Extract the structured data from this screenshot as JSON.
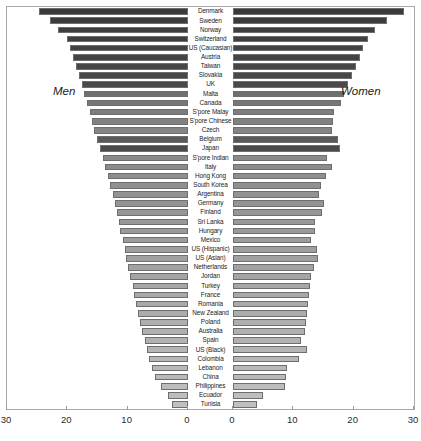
{
  "chart_data": {
    "type": "bar",
    "title": "",
    "subtitle": "",
    "orientation": "horizontal-diverging",
    "xlabel": "",
    "ylabel": "",
    "grid": false,
    "legend_position": "inside-plot",
    "axis": {
      "left_ticks": [
        "30",
        "20",
        "10",
        "0"
      ],
      "right_ticks": [
        "0",
        "10",
        "20",
        "30"
      ],
      "left_range": [
        30,
        0
      ],
      "right_range": [
        0,
        30
      ],
      "max": 30
    },
    "annotations": [
      {
        "text": "Men",
        "side": "left"
      },
      {
        "text": "Women",
        "side": "right"
      }
    ],
    "categories": [
      "Denmark",
      "Sweden",
      "Norway",
      "Switzerland",
      "US (Caucasian)",
      "Austria",
      "Taiwan",
      "Slovakia",
      "UK",
      "Malta",
      "Canada",
      "S'pore Malay",
      "S'pore Chinese",
      "Czech",
      "Belgium",
      "Japan",
      "S'pore Indian",
      "Italy",
      "Hong Kong",
      "South Korea",
      "Argentina",
      "Germany",
      "Finland",
      "Sri Lanka",
      "Hungary",
      "Mexico",
      "US (Hispanic)",
      "US (Asian)",
      "Netherlands",
      "Jordan",
      "Turkey",
      "France",
      "Romania",
      "New Zealand",
      "Poland",
      "Australia",
      "Spain",
      "US (Black)",
      "Colombia",
      "Lebanon",
      "China",
      "Philippines",
      "Ecuador",
      "Tunisia"
    ],
    "series": [
      {
        "name": "Men",
        "side": "left",
        "values": [
          24.7,
          22.8,
          21.5,
          20.0,
          19.5,
          19.0,
          18.6,
          18.1,
          17.6,
          17.2,
          16.8,
          16.3,
          15.9,
          15.5,
          15.1,
          14.6,
          14.1,
          13.7,
          13.3,
          12.9,
          12.5,
          12.1,
          11.8,
          11.5,
          11.2,
          10.8,
          10.5,
          10.2,
          9.9,
          9.6,
          9.2,
          8.9,
          8.6,
          8.3,
          8.0,
          7.6,
          7.2,
          6.8,
          6.4,
          5.9,
          5.4,
          4.4,
          3.3,
          2.6
        ]
      },
      {
        "name": "Women",
        "side": "right",
        "values": [
          28.4,
          25.6,
          23.5,
          22.3,
          21.6,
          21.0,
          20.4,
          19.8,
          19.0,
          18.4,
          17.9,
          16.8,
          16.6,
          16.4,
          17.4,
          17.8,
          15.6,
          16.4,
          15.4,
          14.6,
          14.2,
          15.0,
          14.8,
          13.6,
          13.6,
          12.9,
          14.0,
          14.1,
          13.4,
          12.9,
          12.8,
          12.6,
          12.4,
          12.2,
          12.1,
          12.0,
          11.3,
          12.3,
          11.0,
          9.0,
          8.8,
          8.6,
          4.9,
          4.0
        ]
      }
    ],
    "bar_shades": [
      "#3a3a3a",
      "#3c3c3c",
      "#3e3e3e",
      "#404040",
      "#424242",
      "#444444",
      "#464646",
      "#484848",
      "#4a4a4a",
      "#6f6f6f",
      "#777777",
      "#7d7d7d",
      "#818181",
      "#858585",
      "#5a5a5a",
      "#4a4a4a",
      "#8a8a8a",
      "#8c8c8c",
      "#8e8e8e",
      "#909090",
      "#929292",
      "#949494",
      "#969696",
      "#989898",
      "#9a9a9a",
      "#9c9c9c",
      "#9e9e9e",
      "#a0a0a0",
      "#a2a2a2",
      "#a4a4a4",
      "#a6a6a6",
      "#a8a8a8",
      "#aaaaaa",
      "#acacac",
      "#aeaeae",
      "#b0b0b0",
      "#b2b2b2",
      "#b4b4b4",
      "#b6b6b6",
      "#b8b8b8",
      "#bababa",
      "#bcbcbc",
      "#bebebe",
      "#c0c0c0"
    ]
  }
}
